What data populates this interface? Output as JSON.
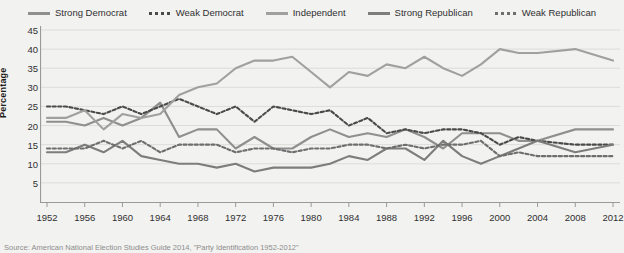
{
  "legend": {
    "position": "top-center",
    "items": [
      {
        "label": "Strong Democrat",
        "style": "solid",
        "color": "#8f8f8f",
        "name": "legend-strong-democrat"
      },
      {
        "label": "Weak Democrat",
        "style": "dashed",
        "color": "#4a4a4a",
        "name": "legend-weak-democrat"
      },
      {
        "label": "Independent",
        "style": "solid",
        "color": "#a0a0a0",
        "name": "legend-independent"
      },
      {
        "label": "Strong Republican",
        "style": "solid",
        "color": "#7d7d7d",
        "name": "legend-strong-republican"
      },
      {
        "label": "Weak Republican",
        "style": "dashed",
        "color": "#6e6e6e",
        "name": "legend-weak-republican"
      }
    ]
  },
  "axes": {
    "ylabel": "Percentage",
    "yticks": [
      45,
      40,
      35,
      30,
      25,
      20,
      15,
      10,
      5
    ],
    "xticks": [
      1952,
      1956,
      1960,
      1964,
      1968,
      1972,
      1976,
      1980,
      1984,
      1988,
      1992,
      1996,
      2000,
      2004,
      2008,
      2012
    ]
  },
  "source": {
    "text": "Source: American National Election Studies Guide 2014, \"Party Identification 1952-2012\""
  },
  "chart_data": {
    "type": "line",
    "title": "",
    "subtitle": "",
    "xlabel": "",
    "ylabel": "Percentage",
    "xlim": [
      1952,
      2012
    ],
    "ylim": [
      0,
      45
    ],
    "grid": true,
    "legend_position": "top-center",
    "x": [
      1952,
      1954,
      1956,
      1958,
      1960,
      1962,
      1964,
      1966,
      1968,
      1970,
      1972,
      1974,
      1976,
      1978,
      1980,
      1982,
      1984,
      1986,
      1988,
      1990,
      1992,
      1994,
      1996,
      1998,
      2000,
      2002,
      2004,
      2008,
      2012
    ],
    "series": [
      {
        "name": "Strong Democrat",
        "style": "solid",
        "color": "#8f8f8f",
        "values": [
          21,
          21,
          20,
          22,
          20,
          22,
          26,
          17,
          19,
          19,
          14,
          17,
          14,
          14,
          17,
          19,
          17,
          18,
          17,
          19,
          17,
          14,
          18,
          18,
          18,
          16,
          16,
          19,
          19
        ]
      },
      {
        "name": "Weak Democrat",
        "style": "dashed",
        "color": "#4a4a4a",
        "values": [
          25,
          25,
          24,
          23,
          25,
          23,
          25,
          27,
          25,
          23,
          25,
          21,
          25,
          24,
          23,
          24,
          20,
          22,
          18,
          19,
          18,
          19,
          19,
          18,
          15,
          17,
          16,
          15,
          15
        ]
      },
      {
        "name": "Independent",
        "style": "solid",
        "color": "#a0a0a0",
        "values": [
          22,
          22,
          24,
          19,
          23,
          22,
          23,
          28,
          30,
          31,
          35,
          37,
          37,
          38,
          34,
          30,
          34,
          33,
          36,
          35,
          38,
          35,
          33,
          36,
          40,
          39,
          39,
          40,
          37
        ]
      },
      {
        "name": "Strong Republican",
        "style": "solid",
        "color": "#7d7d7d",
        "values": [
          13,
          13,
          15,
          13,
          16,
          12,
          11,
          10,
          10,
          9,
          10,
          8,
          9,
          9,
          9,
          10,
          12,
          11,
          14,
          14,
          11,
          16,
          12,
          10,
          12,
          14,
          16,
          13,
          15
        ]
      },
      {
        "name": "Weak Republican",
        "style": "dashed",
        "color": "#6e6e6e",
        "values": [
          14,
          14,
          14,
          16,
          14,
          16,
          13,
          15,
          15,
          15,
          13,
          14,
          14,
          13,
          14,
          14,
          15,
          15,
          14,
          15,
          14,
          15,
          15,
          16,
          12,
          13,
          12,
          12,
          12
        ]
      }
    ]
  }
}
